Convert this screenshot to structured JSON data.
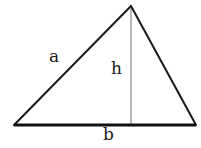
{
  "figure": {
    "kind": "geometry-diagram",
    "shape": "triangle",
    "background_color": "#ffffff",
    "width": 201,
    "height": 148,
    "edge_color": "#1a1a1a",
    "base_color": "#111111",
    "height_line_color": "#9a9a9a",
    "edge_width": 2,
    "base_width": 3,
    "height_line_width": 1.4,
    "vertices": {
      "bottom_left": {
        "x": 14,
        "y": 125
      },
      "bottom_right": {
        "x": 196,
        "y": 125
      },
      "apex": {
        "x": 131,
        "y": 6
      }
    },
    "height_line": {
      "from": {
        "x": 131,
        "y": 6
      },
      "to": {
        "x": 131,
        "y": 125
      }
    },
    "labels": [
      {
        "id": "a",
        "text": "a",
        "x": 49,
        "y": 48,
        "refers_to": "left-side"
      },
      {
        "id": "h",
        "text": "h",
        "x": 111,
        "y": 60,
        "refers_to": "height"
      },
      {
        "id": "b",
        "text": "b",
        "x": 103,
        "y": 126,
        "refers_to": "base"
      }
    ]
  }
}
